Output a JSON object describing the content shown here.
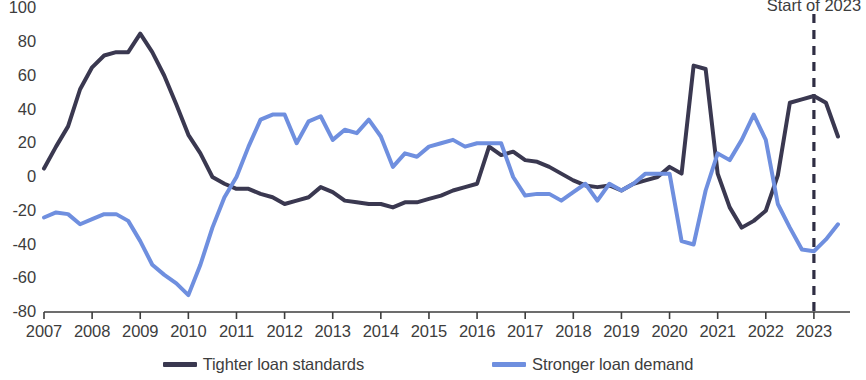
{
  "chart_data": {
    "type": "line",
    "title": "",
    "subtitle": "",
    "xlabel": "",
    "ylabel": "",
    "ylim": [
      -80,
      100
    ],
    "xlim": [
      2007,
      2023.75
    ],
    "grid": false,
    "legend_position": "bottom",
    "y_ticks": [
      100,
      80,
      60,
      40,
      20,
      0,
      -20,
      -40,
      -60,
      -80
    ],
    "x_ticks": [
      2007,
      2008,
      2009,
      2010,
      2011,
      2012,
      2013,
      2014,
      2015,
      2016,
      2017,
      2018,
      2019,
      2020,
      2021,
      2022,
      2023
    ],
    "x_tick_labels": [
      "2007",
      "2008",
      "2009",
      "2010",
      "2011",
      "2012",
      "2013",
      "2014",
      "2015",
      "2016",
      "2017",
      "2018",
      "2019",
      "2020",
      "2021",
      "2022",
      "2023"
    ],
    "annotations": [
      {
        "name": "start-of-2023-marker",
        "text": "Start of 2023",
        "x": 2023,
        "style": "dashed-vertical-line",
        "color": "#2f2d43"
      }
    ],
    "series": [
      {
        "name": "Tighter loan standards",
        "color": "#3a3850",
        "x": [
          2007.0,
          2007.25,
          2007.5,
          2007.75,
          2008.0,
          2008.25,
          2008.5,
          2008.75,
          2009.0,
          2009.25,
          2009.5,
          2009.75,
          2010.0,
          2010.25,
          2010.5,
          2010.75,
          2011.0,
          2011.25,
          2011.5,
          2011.75,
          2012.0,
          2012.25,
          2012.5,
          2012.75,
          2013.0,
          2013.25,
          2013.5,
          2013.75,
          2014.0,
          2014.25,
          2014.5,
          2014.75,
          2015.0,
          2015.25,
          2015.5,
          2015.75,
          2016.0,
          2016.25,
          2016.5,
          2016.75,
          2017.0,
          2017.25,
          2017.5,
          2017.75,
          2018.0,
          2018.25,
          2018.5,
          2018.75,
          2019.0,
          2019.25,
          2019.5,
          2019.75,
          2020.0,
          2020.25,
          2020.5,
          2020.75,
          2021.0,
          2021.25,
          2021.5,
          2021.75,
          2022.0,
          2022.25,
          2022.5,
          2022.75,
          2023.0,
          2023.25,
          2023.5
        ],
        "values": [
          5,
          18,
          30,
          52,
          65,
          72,
          74,
          74,
          85,
          74,
          60,
          43,
          25,
          14,
          0,
          -4,
          -7,
          -7,
          -10,
          -12,
          -16,
          -14,
          -12,
          -6,
          -9,
          -14,
          -15,
          -16,
          -16,
          -18,
          -15,
          -15,
          -13,
          -11,
          -8,
          -6,
          -4,
          18,
          13,
          15,
          10,
          9,
          6,
          2,
          -2,
          -5,
          -6,
          -5,
          -8,
          -4,
          -2,
          0,
          6,
          2,
          66,
          64,
          2,
          -18,
          -30,
          -26,
          -20,
          1,
          44,
          46,
          48,
          44,
          24
        ]
      },
      {
        "name": "Stronger loan demand",
        "color": "#6f8fdf",
        "x": [
          2007.0,
          2007.25,
          2007.5,
          2007.75,
          2008.0,
          2008.25,
          2008.5,
          2008.75,
          2009.0,
          2009.25,
          2009.5,
          2009.75,
          2010.0,
          2010.25,
          2010.5,
          2010.75,
          2011.0,
          2011.25,
          2011.5,
          2011.75,
          2012.0,
          2012.25,
          2012.5,
          2012.75,
          2013.0,
          2013.25,
          2013.5,
          2013.75,
          2014.0,
          2014.25,
          2014.5,
          2014.75,
          2015.0,
          2015.25,
          2015.5,
          2015.75,
          2016.0,
          2016.25,
          2016.5,
          2016.75,
          2017.0,
          2017.25,
          2017.5,
          2017.75,
          2018.0,
          2018.25,
          2018.5,
          2018.75,
          2019.0,
          2019.25,
          2019.5,
          2019.75,
          2020.0,
          2020.25,
          2020.5,
          2020.75,
          2021.0,
          2021.25,
          2021.5,
          2021.75,
          2022.0,
          2022.25,
          2022.5,
          2022.75,
          2023.0,
          2023.25,
          2023.5
        ],
        "values": [
          -24,
          -21,
          -22,
          -28,
          -25,
          -22,
          -22,
          -26,
          -38,
          -52,
          -58,
          -63,
          -70,
          -52,
          -30,
          -12,
          0,
          18,
          34,
          37,
          37,
          20,
          33,
          36,
          22,
          28,
          26,
          34,
          24,
          6,
          14,
          12,
          18,
          20,
          22,
          18,
          20,
          20,
          20,
          0,
          -11,
          -10,
          -10,
          -14,
          -9,
          -4,
          -14,
          -4,
          -8,
          -4,
          2,
          2,
          2,
          -38,
          -40,
          -8,
          14,
          10,
          22,
          37,
          22,
          -16,
          -30,
          -43,
          -44,
          -37,
          -28
        ]
      }
    ]
  },
  "axes": {
    "y_labels": [
      "100",
      "80",
      "60",
      "40",
      "20",
      "0",
      "-20",
      "-40",
      "-60",
      "-80"
    ],
    "x_labels": [
      "2007",
      "2008",
      "2009",
      "2010",
      "2011",
      "2012",
      "2013",
      "2014",
      "2015",
      "2016",
      "2017",
      "2018",
      "2019",
      "2020",
      "2021",
      "2022",
      "2023"
    ]
  },
  "annotation": {
    "label": "Start of 2023"
  },
  "legend": {
    "items": [
      {
        "label": "Tighter loan standards",
        "color": "#3a3850"
      },
      {
        "label": "Stronger loan demand",
        "color": "#6f8fdf"
      }
    ]
  },
  "colors": {
    "standards_line": "#3a3850",
    "demand_line": "#6f8fdf",
    "axis": "#3d3d3d",
    "marker_line": "#2f2d43",
    "background": "#ffffff"
  }
}
